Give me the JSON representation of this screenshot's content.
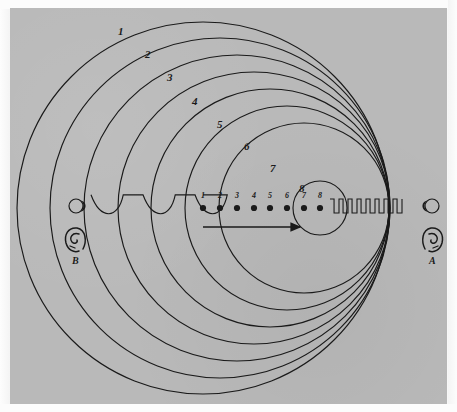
{
  "figure": {
    "background_color": "#b9b9b9",
    "page_color": "#f7f7f7",
    "ink_color": "#1a1a1a"
  },
  "wavefronts": {
    "description": "Eight expanding circular wavefronts emitted from successive source positions",
    "labels": [
      "1",
      "2",
      "3",
      "4",
      "5",
      "6",
      "7",
      "8"
    ],
    "circles": [
      {
        "label": "1",
        "cx": 203,
        "cy": 208,
        "r": 186,
        "label_x": 118,
        "label_y": 26
      },
      {
        "label": "2",
        "cx": 220,
        "cy": 208,
        "r": 170,
        "label_x": 145,
        "label_y": 49
      },
      {
        "label": "3",
        "cx": 237,
        "cy": 208,
        "r": 153,
        "label_x": 167,
        "label_y": 72
      },
      {
        "label": "4",
        "cx": 254,
        "cy": 208,
        "r": 136,
        "label_x": 192,
        "label_y": 96
      },
      {
        "label": "5",
        "cx": 270,
        "cy": 208,
        "r": 119,
        "label_x": 217,
        "label_y": 119
      },
      {
        "label": "6",
        "cx": 287,
        "cy": 208,
        "r": 102,
        "label_x": 244,
        "label_y": 141
      },
      {
        "label": "7",
        "cx": 304,
        "cy": 208,
        "r": 85,
        "label_x": 270,
        "label_y": 163
      },
      {
        "label": "8",
        "cx": 320,
        "cy": 208,
        "r": 27,
        "label_x": 299,
        "label_y": 183
      }
    ]
  },
  "source_positions": {
    "description": "Successive positions of the moving sound source",
    "baseline_y": 208,
    "labels": [
      "1",
      "2",
      "3",
      "4",
      "5",
      "6",
      "7",
      "8"
    ],
    "dots": [
      {
        "label": "1",
        "x": 203,
        "y": 208
      },
      {
        "label": "2",
        "x": 220,
        "y": 208
      },
      {
        "label": "3",
        "x": 237,
        "y": 208
      },
      {
        "label": "4",
        "x": 254,
        "y": 208
      },
      {
        "label": "5",
        "x": 270,
        "y": 208
      },
      {
        "label": "6",
        "x": 287,
        "y": 208
      },
      {
        "label": "7",
        "x": 304,
        "y": 208
      },
      {
        "label": "8",
        "x": 320,
        "y": 208
      }
    ]
  },
  "motion_arrow": {
    "description": "Direction of source motion",
    "x1": 203,
    "y1": 227,
    "x2": 300,
    "y2": 227,
    "direction": "right"
  },
  "left_wave": {
    "description": "Long-wavelength (stretched) wave travelling toward observer B",
    "wavelength": 52,
    "amplitude": 12,
    "x_start": 91,
    "x_end": 203,
    "y": 208
  },
  "right_wave": {
    "description": "Short-wavelength (compressed) wave travelling toward observer A",
    "wavelength": 9,
    "amplitude": 9,
    "x_start": 330,
    "x_end": 400,
    "y": 208
  },
  "observers": [
    {
      "id": "B",
      "label": "B",
      "side": "left",
      "eye_x": 76,
      "eye_y": 206,
      "ear_x": 76,
      "ear_y": 239,
      "label_x": 72,
      "label_y": 256,
      "note": "Observer hearing lowered pitch"
    },
    {
      "id": "A",
      "label": "A",
      "side": "right",
      "eye_x": 432,
      "eye_y": 206,
      "ear_x": 432,
      "ear_y": 239,
      "label_x": 429,
      "label_y": 256,
      "note": "Observer hearing raised pitch"
    }
  ]
}
